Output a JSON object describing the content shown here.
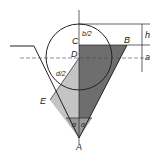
{
  "diagram": {
    "type": "geometric construction: circle in V-groove",
    "points": {
      "A": "A",
      "B": "B",
      "C": "C",
      "D": "D",
      "E": "E"
    },
    "dims": {
      "h": "h",
      "a": "a",
      "b_half": "b/2",
      "d_half": "d/2",
      "alpha": "α"
    },
    "colors": {
      "dark": "#6e6e6e",
      "light": "#c4c4c4",
      "mid": "#9a9a9a",
      "line": "#222222"
    }
  }
}
